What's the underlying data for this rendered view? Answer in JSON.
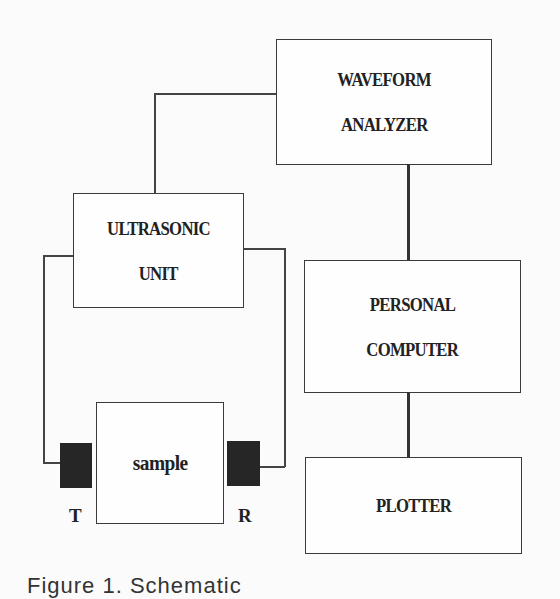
{
  "diagram": {
    "nodes": {
      "waveform_analyzer": {
        "lines": [
          "WAVEFORM",
          "ANALYZER"
        ]
      },
      "ultrasonic_unit": {
        "lines": [
          "ULTRASONIC",
          "UNIT"
        ]
      },
      "personal_computer": {
        "lines": [
          "PERSONAL",
          "COMPUTER"
        ]
      },
      "plotter": {
        "lines": [
          "PLOTTER"
        ]
      },
      "sample": {
        "label": "sample"
      }
    },
    "transducers": {
      "transmitter": {
        "label": "T"
      },
      "receiver": {
        "label": "R"
      }
    },
    "edges": [
      {
        "from": "ultrasonic_unit",
        "to": "waveform_analyzer",
        "style": "thin"
      },
      {
        "from": "ultrasonic_unit",
        "to": "transmitter",
        "style": "thin"
      },
      {
        "from": "ultrasonic_unit",
        "to": "receiver",
        "style": "thin"
      },
      {
        "from": "waveform_analyzer",
        "to": "personal_computer",
        "style": "thick"
      },
      {
        "from": "personal_computer",
        "to": "plotter",
        "style": "thick"
      }
    ],
    "colors": {
      "background": "#fbfbfb",
      "stroke": "#3a3a3a",
      "transducer_fill": "#262626"
    }
  },
  "caption": "Figure 1. Schematic"
}
